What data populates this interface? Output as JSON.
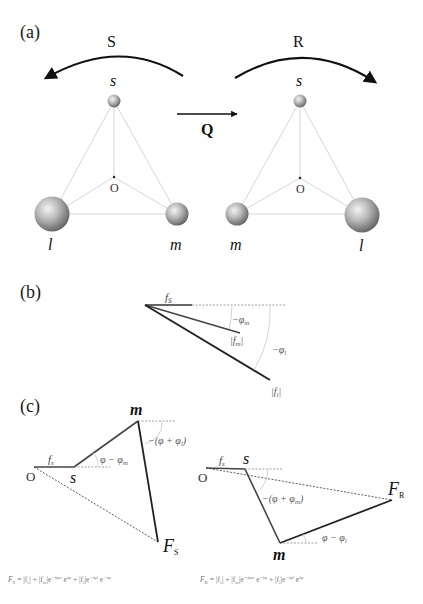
{
  "panel_a": {
    "label": "(a)",
    "operator_left": "S",
    "operator_right": "R",
    "operator_center": "Q",
    "left_tetrahedron": {
      "top": "s",
      "center": "O",
      "bottom_left": "l",
      "bottom_right": "m"
    },
    "right_tetrahedron": {
      "top": "s",
      "center": "O",
      "bottom_left": "m",
      "bottom_right": "l"
    }
  },
  "panel_b": {
    "label": "(b)",
    "fs": "f",
    "fs_sub": "s",
    "phi_m": "−φ",
    "phi_m_sub": "m",
    "fm": "|f",
    "fm_sub": "m",
    "fm_close": "|",
    "phi_l": "−φ",
    "phi_l_sub": "l",
    "fl": "|f",
    "fl_sub": "l",
    "fl_close": "|"
  },
  "panel_c": {
    "label": "(c)",
    "left": {
      "origin": "O",
      "s": "s",
      "m": "m",
      "fs": "f",
      "fs_sub": "s",
      "angle1": "φ − φ",
      "angle1_sub": "m",
      "angle2": "−(φ + φ",
      "angle2_sub": "l",
      "angle2_close": ")",
      "F": "F",
      "F_sub": "S"
    },
    "right": {
      "origin": "O",
      "s": "s",
      "m": "m",
      "fs": "f",
      "fs_sub": "s",
      "angle1": "−(φ + φ",
      "angle1_sub": "m",
      "angle1_close": ")",
      "angle2": "φ − φ",
      "angle2_sub": "l",
      "F": "F",
      "F_sub": "R"
    }
  },
  "formulas": {
    "left": "F_S = |f_s| + |f_m|e^{−iφ_m} e^{iφ} + |f_l|e^{−iφ_l} e^{−iφ}",
    "left_display": "F",
    "left_sub": "S",
    "left_rhs": " = |f",
    "left_rhs_2": "| + |f",
    "left_rhs_3": "|e",
    "left_exp_1": "−iφ",
    "left_exp_1_sub": "m",
    "left_rhs_4": " e",
    "left_exp_2": "iφ",
    "left_rhs_5": " + |f",
    "left_rhs_6": "|e",
    "left_exp_3": "−iφ",
    "left_exp_3_sub": "l",
    "left_rhs_7": " e",
    "left_exp_4": "−iφ",
    "right": "F_R = |f_s| + |f_m|e^{−iφ_m} e^{−iφ} + |f_l|e^{−iφ_l} e^{iφ}",
    "right_display": "F",
    "right_sub": "R",
    "right_exp_2": "−iφ",
    "right_exp_4": "iφ",
    "sub_s": "s",
    "sub_m": "m",
    "sub_l": "l"
  }
}
